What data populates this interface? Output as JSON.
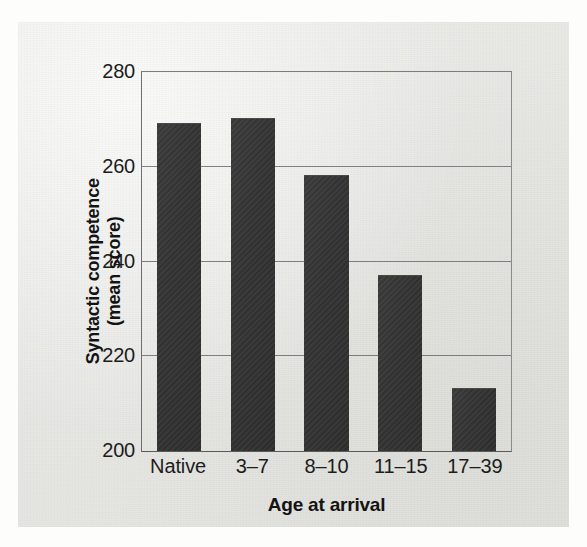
{
  "chart_data": {
    "type": "bar",
    "title": "",
    "xlabel": "Age at arrival",
    "ylabel_line1": "Syntactic competence",
    "ylabel_line2": "(mean score)",
    "categories": [
      "Native",
      "3–17",
      "8–10",
      "11–15",
      "17–39"
    ],
    "category_labels": [
      "Native",
      "3–7",
      "8–10",
      "11–15",
      "17–39"
    ],
    "values": [
      269,
      270,
      258,
      237,
      213
    ],
    "ylim": [
      200,
      280
    ],
    "yticks": [
      280,
      260,
      240,
      220,
      200
    ],
    "ytick_labels": [
      "280",
      "260",
      "240",
      "220",
      "200"
    ],
    "grid": true,
    "grid_axis": "y",
    "legend": "none",
    "bar_color": "#343434",
    "grid_color": "#7f7f7f",
    "axis_color": "#5b5b5b",
    "background_color": "#e7e7e4",
    "bar_width_ratio": 0.6
  },
  "figure": {
    "paper_background": "#e7e7e4",
    "page_background": "#fdfdfc"
  }
}
